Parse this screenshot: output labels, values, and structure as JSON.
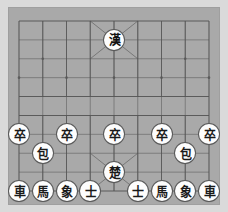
{
  "app": {
    "title": "Xiangqi Board",
    "board_color": "#a9a9a9",
    "matte_color": "#dadada",
    "line_color": "#575757",
    "piece_face_color": "#fdfdfd",
    "piece_text_color": "#161616"
  },
  "board": {
    "files": 9,
    "ranks": 10,
    "river_label_left": "",
    "river_label_right": "",
    "palace_top": "X-diagonals",
    "palace_bottom": "X-diagonals"
  },
  "pieces": [
    {
      "id": "p01",
      "glyph": "漢",
      "name": "black-general",
      "side": "black",
      "file": 4,
      "rank": 1
    },
    {
      "id": "p02",
      "glyph": "卒",
      "name": "red-pawn-1",
      "side": "red",
      "file": 0,
      "rank": 6
    },
    {
      "id": "p03",
      "glyph": "卒",
      "name": "red-pawn-2",
      "side": "red",
      "file": 2,
      "rank": 6
    },
    {
      "id": "p04",
      "glyph": "卒",
      "name": "red-pawn-3",
      "side": "red",
      "file": 4,
      "rank": 6
    },
    {
      "id": "p05",
      "glyph": "卒",
      "name": "red-pawn-4",
      "side": "red",
      "file": 6,
      "rank": 6
    },
    {
      "id": "p06",
      "glyph": "卒",
      "name": "red-pawn-5",
      "side": "red",
      "file": 8,
      "rank": 6
    },
    {
      "id": "p07",
      "glyph": "包",
      "name": "red-cannon-left",
      "side": "red",
      "file": 1,
      "rank": 7
    },
    {
      "id": "p08",
      "glyph": "包",
      "name": "red-cannon-right",
      "side": "red",
      "file": 7,
      "rank": 7
    },
    {
      "id": "p09",
      "glyph": "楚",
      "name": "red-general",
      "side": "red",
      "file": 4,
      "rank": 8
    },
    {
      "id": "p10",
      "glyph": "車",
      "name": "red-chariot-left",
      "side": "red",
      "file": 0,
      "rank": 9
    },
    {
      "id": "p11",
      "glyph": "馬",
      "name": "red-horse-left",
      "side": "red",
      "file": 1,
      "rank": 9
    },
    {
      "id": "p12",
      "glyph": "象",
      "name": "red-elephant-left",
      "side": "red",
      "file": 2,
      "rank": 9
    },
    {
      "id": "p13",
      "glyph": "士",
      "name": "red-advisor-left",
      "side": "red",
      "file": 3,
      "rank": 9
    },
    {
      "id": "p14",
      "glyph": "士",
      "name": "red-advisor-right",
      "side": "red",
      "file": 5,
      "rank": 9
    },
    {
      "id": "p15",
      "glyph": "馬",
      "name": "red-horse-right",
      "side": "red",
      "file": 6,
      "rank": 9
    },
    {
      "id": "p16",
      "glyph": "象",
      "name": "red-elephant-right",
      "side": "red",
      "file": 7,
      "rank": 9
    },
    {
      "id": "p17",
      "glyph": "車",
      "name": "red-chariot-right",
      "side": "red",
      "file": 8,
      "rank": 9
    }
  ],
  "star_points": [
    {
      "file": 1,
      "rank": 2
    },
    {
      "file": 7,
      "rank": 2
    },
    {
      "file": 0,
      "rank": 3
    },
    {
      "file": 2,
      "rank": 3
    },
    {
      "file": 4,
      "rank": 3
    },
    {
      "file": 6,
      "rank": 3
    },
    {
      "file": 8,
      "rank": 3
    },
    {
      "file": 1,
      "rank": 7
    },
    {
      "file": 7,
      "rank": 7
    },
    {
      "file": 0,
      "rank": 6
    },
    {
      "file": 2,
      "rank": 6
    },
    {
      "file": 4,
      "rank": 6
    },
    {
      "file": 6,
      "rank": 6
    },
    {
      "file": 8,
      "rank": 6
    }
  ]
}
